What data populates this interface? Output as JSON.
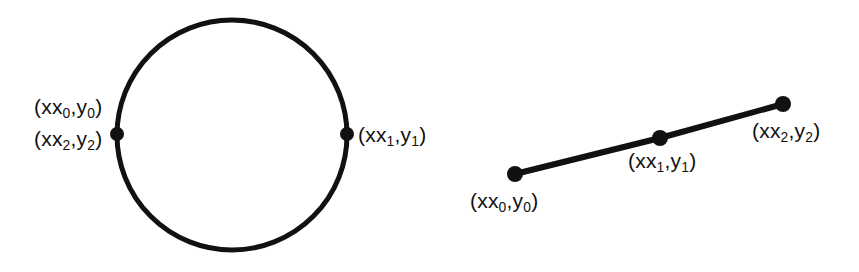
{
  "figure": {
    "background_color": "#ffffff",
    "ink_color": "#111111",
    "width": 859,
    "height": 272,
    "stroke_width": 5,
    "vertex_dot_radius": 7
  },
  "panels": [
    {
      "id": "closed",
      "kind": "closed-polyline-circle",
      "shape": {
        "type": "circle",
        "cx": 232,
        "cy": 135,
        "r": 115,
        "stroke_width": 5
      },
      "vertices": [
        {
          "id": "p0",
          "cx": 117,
          "cy": 134,
          "r": 7
        },
        {
          "id": "p1",
          "cx": 347,
          "cy": 134,
          "r": 7
        }
      ],
      "labels": [
        {
          "id": "closed-p0",
          "open": "(x",
          "sub_a": "0",
          "mid": ",y",
          "sub_b": "0",
          "close": ")"
        },
        {
          "id": "closed-p2",
          "open": "(x",
          "sub_a": "2",
          "mid": ",y",
          "sub_b": "2",
          "close": ")"
        },
        {
          "id": "closed-p1",
          "open": "(x",
          "sub_a": "1",
          "mid": ",y",
          "sub_b": "1",
          "close": ")"
        }
      ]
    },
    {
      "id": "open",
      "kind": "open-polyline-segment",
      "shape": {
        "type": "polyline",
        "points": "515,174 660,138 783,104",
        "stroke_width": 6
      },
      "vertices": [
        {
          "id": "p0",
          "cx": 515,
          "cy": 174,
          "r": 8
        },
        {
          "id": "p1",
          "cx": 660,
          "cy": 138,
          "r": 8
        },
        {
          "id": "p2",
          "cx": 783,
          "cy": 104,
          "r": 8
        }
      ],
      "labels": [
        {
          "id": "open-p0",
          "open": "(x",
          "sub_a": "0",
          "mid": ",y",
          "sub_b": "0",
          "close": ")"
        },
        {
          "id": "open-p1",
          "open": "(x",
          "sub_a": "1",
          "mid": ",y",
          "sub_b": "1",
          "close": ")"
        },
        {
          "id": "open-p2",
          "open": "(x",
          "sub_a": "2",
          "mid": ",y",
          "sub_b": "2",
          "close": ")"
        }
      ]
    }
  ]
}
